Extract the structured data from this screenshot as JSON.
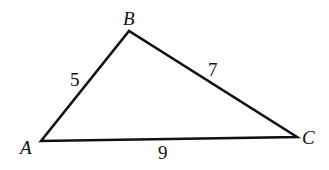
{
  "diagram": {
    "type": "triangle",
    "vertices": [
      {
        "name": "A",
        "x": 41,
        "y": 141
      },
      {
        "name": "B",
        "x": 129,
        "y": 31
      },
      {
        "name": "C",
        "x": 297,
        "y": 137
      }
    ],
    "sides": [
      {
        "from": "A",
        "to": "B",
        "length": "5"
      },
      {
        "from": "B",
        "to": "C",
        "length": "7"
      },
      {
        "from": "A",
        "to": "C",
        "length": "9"
      }
    ],
    "stroke_color": "#111111"
  }
}
